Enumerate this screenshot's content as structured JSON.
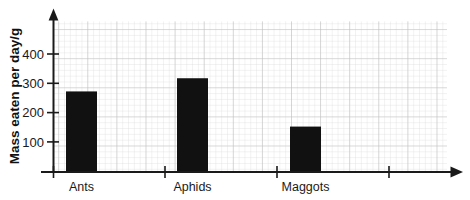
{
  "chart_data": {
    "type": "bar",
    "title": "",
    "subtitle": "",
    "xlabel": "",
    "ylabel": "Mass eaten per day/g",
    "categories": [
      "Ants",
      "Aphids",
      "Maggots"
    ],
    "values": [
      275,
      320,
      155
    ],
    "series": [
      {
        "name": "Mass eaten per day",
        "values": [
          275,
          320,
          155
        ]
      }
    ],
    "ylim": [
      0,
      490
    ],
    "xlim": [
      0,
      4
    ],
    "y_ticks": [
      100,
      200,
      300,
      400
    ],
    "y_tick_labels": [
      "100",
      "200",
      "300",
      "400"
    ],
    "x_tick_count": 4,
    "grid": true,
    "grid_style": "graph-paper minor 5.8px major every 5",
    "legend": "none",
    "legend_position": "none",
    "bar_color": "#111111",
    "axis_color": "#1a1a1a",
    "grid_minor_color": "#d9d9d9",
    "grid_major_color": "#bfbfbf",
    "background_color": "#ffffff",
    "annotations": [],
    "axis_arrows": {
      "y_axis": "arrow-up",
      "x_axis": "arrow-right"
    }
  },
  "axis": {
    "y_label": "Mass eaten per day/g",
    "ticks": {
      "t400": "400",
      "t300": "300",
      "t200": "200",
      "t100": "100"
    }
  },
  "categories": {
    "c0": "Ants",
    "c1": "Aphids",
    "c2": "Maggots"
  }
}
